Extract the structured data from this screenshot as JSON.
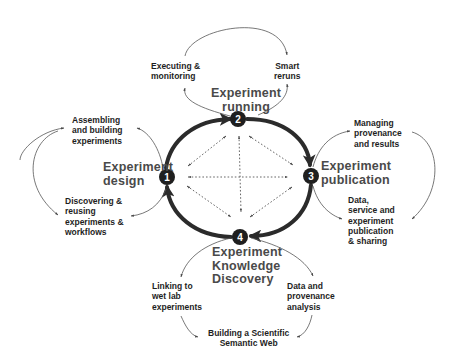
{
  "diagram": {
    "type": "cycle",
    "stages": [
      {
        "id": 1,
        "number": "1",
        "label": "Experiment\ndesign"
      },
      {
        "id": 2,
        "number": "2",
        "label": "Experiment\nrunning"
      },
      {
        "id": 3,
        "number": "3",
        "label": "Experiment\npublication"
      },
      {
        "id": 4,
        "number": "4",
        "label": "Experiment\nKnowledge\nDiscovery"
      }
    ],
    "activities": {
      "design": [
        {
          "label": "Assembling\nand building\nexperiments"
        },
        {
          "label": "Discovering &\nreusing\nexperiments &\nworkflows"
        }
      ],
      "running": [
        {
          "label": "Executing &\nmonitoring"
        },
        {
          "label": "Smart\nreruns"
        }
      ],
      "publication": [
        {
          "label": "Managing\nprovenance\nand results"
        },
        {
          "label": "Data,\nservice and\nexperiment\npublication\n& sharing"
        }
      ],
      "discovery": [
        {
          "label": "Linking to\nwet lab\nexperiments"
        },
        {
          "label": "Data and\nprovenance\nanalysis"
        },
        {
          "label": "Building a Scientific\nSemantic Web"
        }
      ]
    },
    "colors": {
      "cycle_stroke": "#2b2b2b",
      "node_fill": "#1f1f1f",
      "stage_text": "#4a4a4a",
      "activity_text": "#1e1e1e",
      "thin_arrow": "#555555",
      "background": "#ffffff"
    }
  }
}
